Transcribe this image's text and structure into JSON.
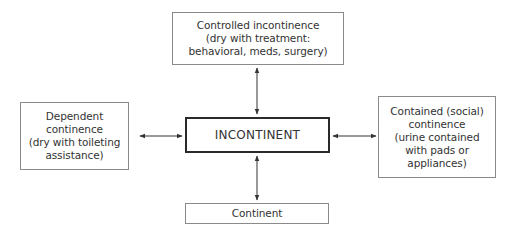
{
  "diagram": {
    "center": {
      "label": "INCONTINENT"
    },
    "nodes": {
      "top": {
        "lines": [
          "Controlled incontinence",
          "(dry with treatment:",
          "behavioral, meds, surgery)"
        ]
      },
      "left": {
        "lines": [
          "Dependent",
          "continence",
          "(dry with toileting",
          "assistance)"
        ]
      },
      "right": {
        "lines": [
          "Contained (social)",
          "continence",
          "(urine contained",
          "with pads or",
          "appliances)"
        ]
      },
      "bottom": {
        "lines": [
          "Continent"
        ]
      }
    },
    "edges": [
      {
        "from": "INCONTINENT",
        "to": "Controlled incontinence",
        "type": "bidirectional"
      },
      {
        "from": "INCONTINENT",
        "to": "Dependent continence",
        "type": "bidirectional"
      },
      {
        "from": "INCONTINENT",
        "to": "Contained (social) continence",
        "type": "bidirectional"
      },
      {
        "from": "INCONTINENT",
        "to": "Continent",
        "type": "bidirectional"
      }
    ],
    "colors": {
      "box_border": "#8a8a8a",
      "center_border": "#2a2a2a",
      "text": "#333333",
      "arrow": "#333333"
    }
  }
}
